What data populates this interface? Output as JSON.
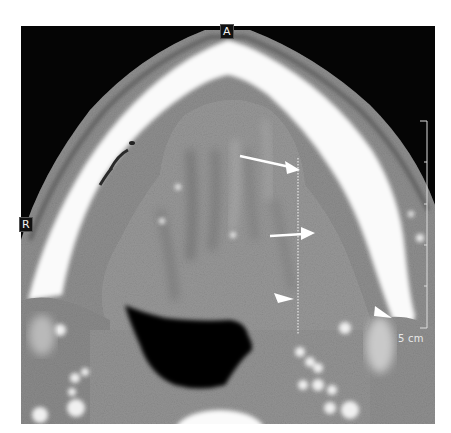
{
  "image": {
    "type": "axial contrast-enhanced CT, floor of mouth / oral tongue level",
    "frame": {
      "x": 21,
      "y": 26,
      "width": 414,
      "height": 398
    }
  },
  "orientation_labels": {
    "anterior": "A",
    "right": "R"
  },
  "scale_bar": {
    "label": "5 cm",
    "ticks": 5
  },
  "annotations": {
    "arrows": [
      {
        "name": "upper-arrow",
        "tip": [
          300,
          170
        ]
      },
      {
        "name": "middle-arrow",
        "tip": [
          314,
          234
        ]
      },
      {
        "name": "arrowhead-medial",
        "tip": [
          294,
          299
        ]
      },
      {
        "name": "arrowhead-lateral",
        "tip": [
          393,
          318
        ]
      }
    ],
    "dotted_line": {
      "x": 298,
      "y1": 158,
      "y2": 335
    }
  },
  "colors": {
    "background": "#ffffff",
    "air": "#050505",
    "bone": "#ffffff",
    "soft_tissue": "#9a9a9a",
    "annotation": "#ffffff"
  }
}
